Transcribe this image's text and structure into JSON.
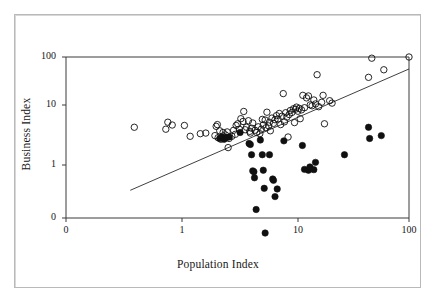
{
  "figure": {
    "background_color": "#ffffff",
    "frame_color": "#b9b9b9",
    "axis_color": "#3a3a3a",
    "marker_color": "#101010"
  },
  "chart_data": {
    "type": "scatter",
    "title": "",
    "subtitle": "",
    "xlabel": "Population Index",
    "ylabel": "Business Index",
    "xscale": "log",
    "yscale": "log",
    "xlim": [
      0.3,
      100
    ],
    "ylim": [
      0.08,
      100
    ],
    "xticks": [
      0,
      1,
      10,
      100
    ],
    "xtick_labels": [
      "0",
      "1",
      "10",
      "100"
    ],
    "yticks": [
      0,
      1,
      10,
      100
    ],
    "ytick_labels": [
      "0",
      "1",
      "10",
      "100"
    ],
    "grid": false,
    "legend": "none",
    "annotations": [],
    "series": [
      {
        "name": "open-circles",
        "marker": "open-circle",
        "marker_size": 4,
        "color": "#101010",
        "fill": "none",
        "points": [
          [
            0.38,
            5.0
          ],
          [
            0.72,
            4.6
          ],
          [
            0.75,
            6.2
          ],
          [
            0.82,
            5.5
          ],
          [
            1.05,
            5.4
          ],
          [
            1.18,
            3.4
          ],
          [
            1.45,
            3.8
          ],
          [
            1.62,
            3.9
          ],
          [
            1.95,
            3.5
          ],
          [
            2.0,
            5.2
          ],
          [
            2.05,
            5.6
          ],
          [
            2.08,
            3.2
          ],
          [
            2.15,
            4.3
          ],
          [
            2.2,
            3.0
          ],
          [
            2.3,
            4.0
          ],
          [
            2.35,
            3.3
          ],
          [
            2.42,
            3.6
          ],
          [
            2.5,
            4.1
          ],
          [
            2.55,
            2.1
          ],
          [
            2.6,
            3.1
          ],
          [
            2.75,
            3.4
          ],
          [
            2.85,
            4.4
          ],
          [
            2.95,
            3.7
          ],
          [
            3.0,
            5.4
          ],
          [
            3.1,
            5.8
          ],
          [
            3.2,
            4.6
          ],
          [
            3.3,
            7.2
          ],
          [
            3.45,
            6.4
          ],
          [
            3.5,
            9.8
          ],
          [
            3.6,
            4.5
          ],
          [
            3.7,
            5.0
          ],
          [
            3.85,
            6.6
          ],
          [
            3.95,
            4.2
          ],
          [
            4.0,
            3.9
          ],
          [
            4.1,
            4.8
          ],
          [
            4.2,
            6.0
          ],
          [
            4.4,
            4.4
          ],
          [
            4.55,
            4.0
          ],
          [
            4.7,
            5.1
          ],
          [
            4.85,
            3.8
          ],
          [
            5.0,
            4.6
          ],
          [
            5.1,
            7.0
          ],
          [
            5.2,
            5.5
          ],
          [
            5.4,
            6.8
          ],
          [
            5.5,
            4.9
          ],
          [
            5.6,
            9.5
          ],
          [
            5.8,
            5.3
          ],
          [
            5.9,
            6.2
          ],
          [
            6.0,
            4.3
          ],
          [
            6.2,
            7.4
          ],
          [
            6.4,
            5.9
          ],
          [
            6.6,
            6.9
          ],
          [
            6.8,
            8.2
          ],
          [
            7.0,
            7.1
          ],
          [
            7.2,
            9.0
          ],
          [
            7.4,
            5.6
          ],
          [
            7.6,
            8.0
          ],
          [
            7.8,
            21.0
          ],
          [
            8.0,
            6.3
          ],
          [
            8.2,
            9.3
          ],
          [
            8.4,
            7.7
          ],
          [
            8.6,
            3.3
          ],
          [
            8.8,
            8.6
          ],
          [
            9.0,
            10.2
          ],
          [
            9.3,
            9.4
          ],
          [
            9.6,
            11.0
          ],
          [
            9.8,
            6.1
          ],
          [
            10.0,
            10.8
          ],
          [
            10.2,
            11.8
          ],
          [
            10.5,
            9.9
          ],
          [
            10.8,
            11.2
          ],
          [
            11.0,
            7.2
          ],
          [
            11.3,
            10.5
          ],
          [
            11.6,
            19.5
          ],
          [
            12.0,
            11.5
          ],
          [
            12.5,
            17.5
          ],
          [
            13.0,
            19.0
          ],
          [
            13.5,
            13.0
          ],
          [
            14.0,
            12.5
          ],
          [
            14.5,
            16.0
          ],
          [
            15.0,
            13.5
          ],
          [
            15.5,
            47.0
          ],
          [
            16.0,
            12.0
          ],
          [
            17.0,
            14.5
          ],
          [
            17.5,
            19.5
          ],
          [
            18.0,
            5.8
          ],
          [
            20.0,
            15.5
          ],
          [
            21.0,
            14.0
          ],
          [
            44.0,
            42.0
          ],
          [
            47.0,
            95.0
          ],
          [
            60.0,
            58.0
          ],
          [
            100.0,
            100.0
          ]
        ]
      },
      {
        "name": "filled-circles",
        "marker": "filled-circle",
        "marker_size": 4,
        "color": "#101010",
        "fill": "#101010",
        "points": [
          [
            2.15,
            3.1
          ],
          [
            2.25,
            3.3
          ],
          [
            2.35,
            3.0
          ],
          [
            2.45,
            3.2
          ],
          [
            2.6,
            3.3
          ],
          [
            3.25,
            4.0
          ],
          [
            3.9,
            2.5
          ],
          [
            4.0,
            2.4
          ],
          [
            4.1,
            1.55
          ],
          [
            4.2,
            0.78
          ],
          [
            4.3,
            0.75
          ],
          [
            4.35,
            0.58
          ],
          [
            4.5,
            0.15
          ],
          [
            4.9,
            2.9
          ],
          [
            5.1,
            1.55
          ],
          [
            5.2,
            0.8
          ],
          [
            5.3,
            0.37
          ],
          [
            5.4,
            0.055
          ],
          [
            5.9,
            1.55
          ],
          [
            6.3,
            0.55
          ],
          [
            6.4,
            0.52
          ],
          [
            6.6,
            0.26
          ],
          [
            6.9,
            0.36
          ],
          [
            7.9,
            2.8
          ],
          [
            11.5,
            2.3
          ],
          [
            12.0,
            0.83
          ],
          [
            13.0,
            0.8
          ],
          [
            13.4,
            0.92
          ],
          [
            14.5,
            0.82
          ],
          [
            15.0,
            1.12
          ],
          [
            27.0,
            1.55
          ],
          [
            44.0,
            5.0
          ],
          [
            45.0,
            3.1
          ],
          [
            57.0,
            3.5
          ]
        ]
      }
    ],
    "trend_line": {
      "name": "regression-line",
      "color": "#2a2a2a",
      "x_start": 0.35,
      "y_start": 0.34,
      "x_end": 100,
      "y_end": 60
    }
  }
}
